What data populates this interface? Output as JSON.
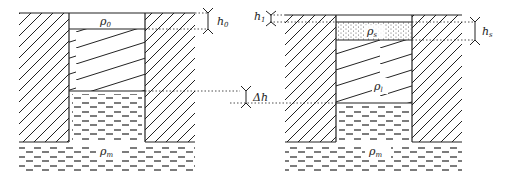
{
  "diagram": {
    "left_panel": {
      "labels": {
        "water_density": "ρ",
        "water_density_sub": "0",
        "mantle_density": "ρ",
        "mantle_density_sub": "m",
        "water_depth": "h",
        "water_depth_sub": "0"
      }
    },
    "center": {
      "labels": {
        "delta_h": "Δh"
      }
    },
    "right_panel": {
      "labels": {
        "sediment_density": "ρ",
        "sediment_density_sub": "s",
        "infill_density": "ρ",
        "infill_density_sub": "l",
        "mantle_density": "ρ",
        "mantle_density_sub": "m",
        "top_gap": "h",
        "top_gap_sub": "1",
        "sediment_thickness": "h",
        "sediment_thickness_sub": "s"
      }
    },
    "colors": {
      "line": "#222222",
      "background": "#ffffff"
    }
  }
}
